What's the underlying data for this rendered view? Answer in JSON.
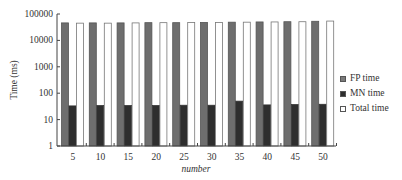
{
  "chart_data": {
    "type": "bar",
    "title": "",
    "xlabel": "number",
    "ylabel": "Time (ms)",
    "yscale": "log",
    "ylim": [
      1,
      100000
    ],
    "yticks": [
      "1",
      "10",
      "100",
      "1000",
      "10000",
      "100000"
    ],
    "categories": [
      "5",
      "10",
      "15",
      "20",
      "25",
      "30",
      "35",
      "40",
      "45",
      "50"
    ],
    "series": [
      {
        "name": "FP time",
        "color": "#6e6e6e",
        "values": [
          46000,
          46000,
          46000,
          47000,
          47000,
          48000,
          49000,
          50000,
          51000,
          53000
        ]
      },
      {
        "name": "MN time",
        "color": "#2e2e2e",
        "values": [
          33,
          34,
          34,
          34,
          35,
          35,
          50,
          36,
          37,
          38
        ]
      },
      {
        "name": "Total time",
        "color": "#ffffff",
        "values": [
          45000,
          45000,
          46000,
          47000,
          48000,
          48000,
          49000,
          50000,
          51000,
          54000
        ]
      }
    ],
    "legend_position": "right",
    "grid": false
  },
  "legend": {
    "items": [
      {
        "label": "FP time",
        "color": "#7a7a7a"
      },
      {
        "label": "MN time",
        "color": "#2e2e2e"
      },
      {
        "label": "Total time",
        "color": "#ffffff"
      }
    ]
  }
}
